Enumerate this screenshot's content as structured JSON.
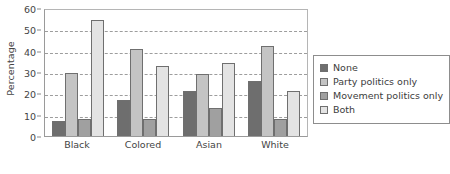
{
  "chart_data": {
    "type": "bar",
    "title": "",
    "subtitle": "",
    "xlabel": "",
    "ylabel": "Percentage",
    "categories": [
      "Black",
      "Colored",
      "Asian",
      "White"
    ],
    "series": [
      {
        "name": "None",
        "values": [
          7,
          17,
          21,
          26
        ],
        "color": "#6e6e6e"
      },
      {
        "name": "Party politics only",
        "values": [
          29.5,
          41,
          29,
          42
        ],
        "color": "#c4c4c4"
      },
      {
        "name": "Movement politics only",
        "values": [
          8,
          8,
          13,
          8
        ],
        "color": "#a0a0a0"
      },
      {
        "name": "Both",
        "values": [
          54.5,
          33,
          34,
          21
        ],
        "color": "#e3e3e3"
      }
    ],
    "ylim": [
      0,
      60
    ],
    "yticks": [
      0,
      10,
      20,
      30,
      40,
      50,
      60
    ],
    "ytick_labels": [
      "0",
      "10",
      "20",
      "30",
      "40",
      "50",
      "60"
    ],
    "grid": true,
    "grid_style": "dashed",
    "grid_axis": "y",
    "legend_position": "right",
    "legend_entries": [
      "None",
      "Party politics only",
      "Movement politics only",
      "Both"
    ]
  },
  "axes": {
    "y_title": "Percentage"
  }
}
